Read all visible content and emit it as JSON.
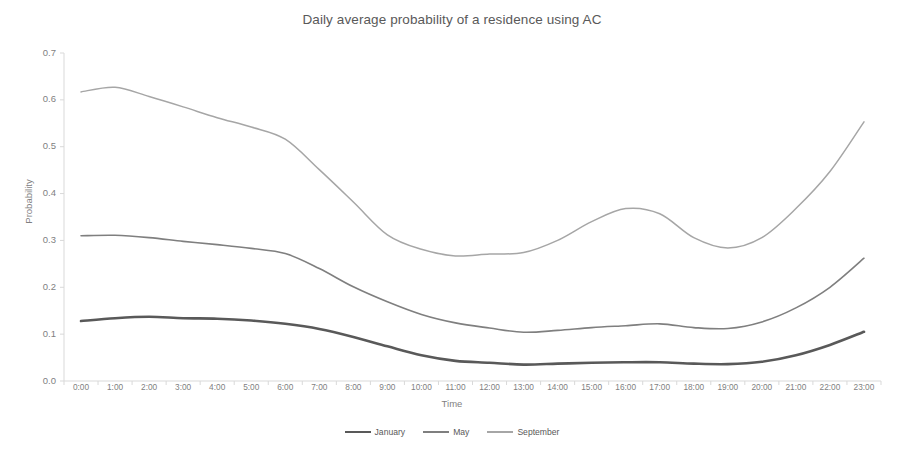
{
  "chart_data": {
    "type": "line",
    "title": "Daily average probability of a residence using AC",
    "xlabel": "Time",
    "ylabel": "Probability",
    "ylim": [
      0.0,
      0.7
    ],
    "ytick_labels": [
      "0.0",
      "0.1",
      "0.2",
      "0.3",
      "0.4",
      "0.5",
      "0.6",
      "0.7"
    ],
    "ytick_values": [
      0.0,
      0.1,
      0.2,
      0.3,
      0.4,
      0.5,
      0.6,
      0.7
    ],
    "grid": false,
    "legend_position": "bottom",
    "categories": [
      "0:00",
      "1:00",
      "2:00",
      "3:00",
      "4:00",
      "5:00",
      "6:00",
      "7:00",
      "8:00",
      "9:00",
      "10:00",
      "11:00",
      "12:00",
      "13:00",
      "14:00",
      "15:00",
      "16:00",
      "17:00",
      "18:00",
      "19:00",
      "20:00",
      "21:00",
      "22:00",
      "23:00"
    ],
    "series": [
      {
        "name": "January",
        "color": "#595959",
        "values": [
          0.128,
          0.134,
          0.137,
          0.134,
          0.133,
          0.129,
          0.122,
          0.111,
          0.094,
          0.074,
          0.055,
          0.043,
          0.039,
          0.035,
          0.037,
          0.039,
          0.04,
          0.04,
          0.037,
          0.036,
          0.041,
          0.055,
          0.077,
          0.105
        ]
      },
      {
        "name": "May",
        "color": "#7f7f7f",
        "values": [
          0.31,
          0.311,
          0.306,
          0.298,
          0.291,
          0.283,
          0.272,
          0.24,
          0.201,
          0.169,
          0.142,
          0.124,
          0.113,
          0.104,
          0.108,
          0.114,
          0.118,
          0.122,
          0.114,
          0.112,
          0.126,
          0.156,
          0.2,
          0.262
        ]
      },
      {
        "name": "September",
        "color": "#a6a6a6",
        "values": [
          0.617,
          0.627,
          0.607,
          0.585,
          0.562,
          0.542,
          0.516,
          0.451,
          0.382,
          0.312,
          0.281,
          0.267,
          0.271,
          0.274,
          0.3,
          0.34,
          0.368,
          0.357,
          0.306,
          0.284,
          0.306,
          0.368,
          0.447,
          0.553
        ]
      }
    ]
  }
}
